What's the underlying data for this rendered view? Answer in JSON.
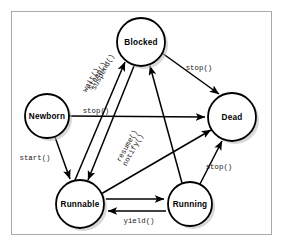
{
  "diagram": {
    "frame": {
      "border_color": "#a9a9a9",
      "background": "#ffffff"
    },
    "node_style": {
      "fill": "#ffffff",
      "stroke": "#000000",
      "shadow": "#b8b8b8"
    },
    "edge_style": {
      "stroke": "#000000"
    },
    "nodes": [
      {
        "id": "newborn",
        "label": "Newborn",
        "cx": 47,
        "cy": 116,
        "r": 22
      },
      {
        "id": "blocked",
        "label": "Blocked",
        "cx": 141,
        "cy": 42,
        "r": 24
      },
      {
        "id": "dead",
        "label": "Dead",
        "cx": 232,
        "cy": 117,
        "r": 24
      },
      {
        "id": "runnable",
        "label": "Runnable",
        "cx": 80,
        "cy": 204,
        "r": 24
      },
      {
        "id": "running",
        "label": "Running",
        "cx": 190,
        "cy": 204,
        "r": 22
      }
    ],
    "edges": [
      {
        "id": "newborn-dead",
        "from": "newborn",
        "to": "dead",
        "label": "stop()",
        "label_x": 96,
        "label_y": 111,
        "rotate": 0
      },
      {
        "id": "newborn-runnable",
        "from": "newborn",
        "to": "runnable",
        "label": "start()",
        "label_x": 35,
        "label_y": 158,
        "rotate": 0
      },
      {
        "id": "blocked-dead",
        "from": "blocked",
        "to": "dead",
        "label": "stop()",
        "label_x": 199,
        "label_y": 68,
        "rotate": 0
      },
      {
        "id": "runnable-blocked",
        "from": "runnable",
        "to": "blocked",
        "label": "suspend()",
        "label_x": 101,
        "label_y": 75,
        "rotate": -61
      },
      {
        "id": "runnable-blocked-2",
        "from": "runnable",
        "to": "blocked",
        "label": "sleep()",
        "label_x": 96,
        "label_y": 78,
        "rotate": -61
      },
      {
        "id": "runnable-blocked-3",
        "from": "runnable",
        "to": "blocked",
        "label": "wait()",
        "label_x": 91,
        "label_y": 81,
        "rotate": -61
      },
      {
        "id": "blocked-runnable",
        "from": "blocked",
        "to": "runnable",
        "label": "resume()",
        "label_x": 128,
        "label_y": 148,
        "rotate": -61
      },
      {
        "id": "blocked-runnable-2",
        "from": "blocked",
        "to": "runnable",
        "label": "notify()",
        "label_x": 134,
        "label_y": 151,
        "rotate": -61
      },
      {
        "id": "running-blocked",
        "from": "running",
        "to": "blocked",
        "label": "",
        "label_x": 0,
        "label_y": 0,
        "rotate": 0
      },
      {
        "id": "runnable-dead",
        "from": "runnable",
        "to": "dead",
        "label": "",
        "label_x": 0,
        "label_y": 0,
        "rotate": 0
      },
      {
        "id": "running-dead",
        "from": "running",
        "to": "dead",
        "label": "stop()",
        "label_x": 219,
        "label_y": 167,
        "rotate": 0
      },
      {
        "id": "runnable-running",
        "from": "runnable",
        "to": "running",
        "label": "",
        "label_x": 0,
        "label_y": 0,
        "rotate": 0
      },
      {
        "id": "running-runnable",
        "from": "running",
        "to": "runnable",
        "label": "yield()",
        "label_x": 136,
        "label_y": 219,
        "rotate": 0
      }
    ]
  }
}
